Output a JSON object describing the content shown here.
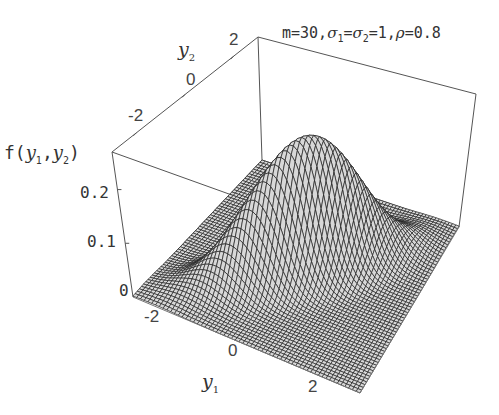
{
  "chart_data": {
    "type": "surface3d",
    "title_parts": {
      "m": "m=30,",
      "sigma": "σ",
      "sigma1_sub": "1",
      "eq": "=",
      "sigma2_sub": "2",
      "rest": "=1,",
      "rho": "ρ",
      "rho_val": "=0.8"
    },
    "function": "bivariate normal density",
    "parameters": {
      "m": 30,
      "sigma1": 1,
      "sigma2": 1,
      "rho": 0.8
    },
    "xlabel": "y1",
    "ylabel": "y2",
    "zlabel": "f(y1,y2)",
    "xlim": [
      -3,
      3
    ],
    "ylim": [
      -3,
      3
    ],
    "zlim": [
      0,
      0.27
    ],
    "x_ticks": [
      "-2",
      "0",
      "2"
    ],
    "y_ticks": [
      "-2",
      "0",
      "2"
    ],
    "z_ticks": [
      "0",
      "0.1",
      "0.2"
    ],
    "peak_value": 0.265,
    "grid_resolution": 30,
    "mesh_color": "#222222",
    "face_color": "#d8d8d8"
  },
  "labels": {
    "z_axis": {
      "f": "f(",
      "y1": "y",
      "sub1": "1",
      "comma": ",",
      "y2": "y",
      "sub2": "2",
      "close": ")"
    },
    "x_axis": {
      "y": "y",
      "sub": "1"
    },
    "y_axis": {
      "y": "y",
      "sub": "2"
    }
  }
}
